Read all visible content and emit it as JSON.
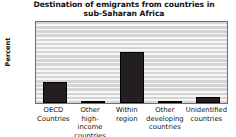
{
  "chart_data": {
    "type": "bar",
    "title": "Destination of emigrants from countries in sub-Saharan Africa",
    "title_line1": "Destination of emigrants from countries in",
    "title_line2": "sub-Saharan Africa",
    "xlabel": "",
    "ylabel": "Percent",
    "ylim": [
      0,
      100
    ],
    "yticks": [
      0,
      20,
      40,
      60,
      80,
      100
    ],
    "grid": true,
    "legend": "none",
    "bar_color": "#231f20",
    "plot_background": "#d4d4d4",
    "categories": [
      "OECD Countries",
      "Other high-income countries",
      "Within region",
      "Other developing countries",
      "Unidentified countries"
    ],
    "category_lines": [
      [
        "OECD",
        "Countries"
      ],
      [
        "Other",
        "high-income",
        "countries"
      ],
      [
        "Within",
        "region"
      ],
      [
        "Other",
        "developing",
        "countries"
      ],
      [
        "Unidentified",
        "countries"
      ]
    ],
    "values": [
      26,
      2,
      63,
      1,
      7
    ]
  }
}
